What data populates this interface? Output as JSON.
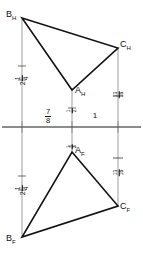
{
  "drawing": {
    "title": "Orthographic projection of a triangle",
    "line_color": "#1a1a1a",
    "thin_line_color": "#555555",
    "background": "#ffffff"
  },
  "ground_line": {
    "name": "reference-line",
    "y": 127,
    "x_start": 2,
    "x_end": 141
  },
  "views": {
    "horizontal": {
      "label": "H",
      "vertices": [
        {
          "name": "B-horizontal",
          "label_letter": "B",
          "label_sub": "H",
          "x": 22,
          "y": 18
        },
        {
          "name": "C-horizontal",
          "label_letter": "C",
          "label_sub": "H",
          "x": 118,
          "y": 48
        },
        {
          "name": "A-horizontal",
          "label_letter": "A",
          "label_sub": "H",
          "x": 72,
          "y": 90
        }
      ]
    },
    "frontal": {
      "label": "F",
      "vertices": [
        {
          "name": "A-frontal",
          "label_letter": "A",
          "label_sub": "F",
          "x": 72,
          "y": 152
        },
        {
          "name": "C-frontal",
          "label_letter": "C",
          "label_sub": "F",
          "x": 118,
          "y": 206
        },
        {
          "name": "B-frontal",
          "label_letter": "B",
          "label_sub": "F",
          "x": 22,
          "y": 237
        }
      ]
    }
  },
  "projection_lines": [
    {
      "name": "projector-B",
      "x": 22,
      "y_top": 18,
      "y_bottom": 237
    },
    {
      "name": "projector-A",
      "x": 72,
      "y_top": 90,
      "y_bottom": 152
    },
    {
      "name": "projector-C",
      "x": 118,
      "y_top": 48,
      "y_bottom": 206
    }
  ],
  "dimensions": {
    "baseline_left": {
      "whole": "7",
      "num": "7",
      "den": "8",
      "kind": "fraction",
      "x": 47,
      "y": 113
    },
    "baseline_right": {
      "value": "1",
      "kind": "whole",
      "x": 95,
      "y": 113
    },
    "left_upper": {
      "whole": "2",
      "num": "1",
      "den": "4",
      "kind": "mixed",
      "x": 22,
      "y": 72
    },
    "left_lower": {
      "whole": "2",
      "num": "1",
      "den": "4",
      "kind": "mixed",
      "x": 22,
      "y": 182
    },
    "right_upper": {
      "whole": "",
      "num": "13",
      "den": "16",
      "kind": "fraction",
      "x": 118,
      "y": 88
    },
    "right_lower": {
      "whole": "",
      "num": "13",
      "den": "16",
      "kind": "fraction",
      "x": 118,
      "y": 166
    },
    "center_upper": {
      "whole": "",
      "num": "1",
      "den": "2",
      "kind": "fraction",
      "x": 72,
      "y": 104
    },
    "center_lower": {
      "whole": "",
      "num": "1",
      "den": "2",
      "kind": "fraction",
      "x": 72,
      "y": 140
    }
  }
}
